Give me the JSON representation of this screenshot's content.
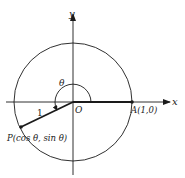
{
  "diagram": {
    "type": "unit-circle",
    "colors": {
      "stroke": "#1a1a1a",
      "background": "#ffffff"
    },
    "axes": {
      "x_label": "x",
      "y_label": "y"
    },
    "origin_label": "O",
    "angle_label": "θ",
    "radius_label": "1",
    "point_a": {
      "name": "A",
      "coords": "(1,0)",
      "full": "A(1,0)"
    },
    "point_p": {
      "name": "P",
      "coords": "(cos θ, sin θ)",
      "full": "P(cos θ, sin θ)"
    }
  }
}
